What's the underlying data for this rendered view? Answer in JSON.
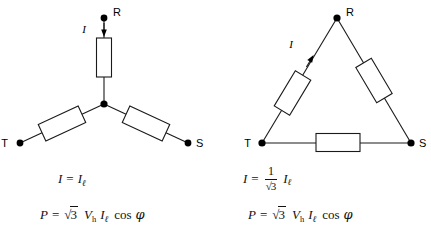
{
  "figure": {
    "stroke_color": "#1a1a1a",
    "background_color": "#ffffff"
  },
  "star": {
    "name": "star-connection",
    "terminals": [
      {
        "id": "R",
        "label": "R"
      },
      {
        "id": "S",
        "label": "S"
      },
      {
        "id": "T",
        "label": "T"
      }
    ],
    "current_label": "I",
    "resistor_count": 3,
    "equations": {
      "current": {
        "lhs": "I",
        "rhs_symbol": "I",
        "rhs_subscript": "ℓ"
      },
      "power": {
        "lhs": "P",
        "radicand": "3",
        "voltage_symbol": "V",
        "voltage_subscript": "h",
        "current_symbol": "I",
        "current_subscript": "ℓ",
        "cos": "cos",
        "angle": "φ"
      }
    }
  },
  "delta": {
    "name": "delta-connection",
    "terminals": [
      {
        "id": "R",
        "label": "R"
      },
      {
        "id": "S",
        "label": "S"
      },
      {
        "id": "T",
        "label": "T"
      }
    ],
    "current_label": "I",
    "resistor_count": 3,
    "equations": {
      "current": {
        "lhs": "I",
        "numerator": "1",
        "denominator_radicand": "3",
        "rhs_symbol": "I",
        "rhs_subscript": "ℓ"
      },
      "power": {
        "lhs": "P",
        "radicand": "3",
        "voltage_symbol": "V",
        "voltage_subscript": "h",
        "current_symbol": "I",
        "current_subscript": "ℓ",
        "cos": "cos",
        "angle": "φ"
      }
    }
  },
  "symbols": {
    "equals": "=",
    "radical_sign": "√"
  }
}
